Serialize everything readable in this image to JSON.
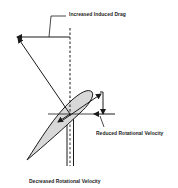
{
  "diagram": {
    "labels": {
      "induced_drag": "Increased Induced Drag",
      "reduced_rotational": "Reduced Rotational Velocity",
      "caption": "Decreased Rotational Velocity"
    },
    "colors": {
      "line": "#1a1a1a",
      "airfoil_fill": "#d8d8d8",
      "background": "#ffffff"
    }
  }
}
